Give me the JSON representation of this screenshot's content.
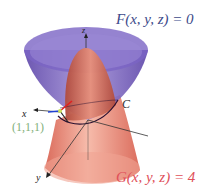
{
  "figure": {
    "surface_top_label": "F(x, y, z) = 0",
    "surface_bottom_label": "G(x, y, z) = 4",
    "curve_label": "C",
    "point_label": "(1,1,1)",
    "axes": {
      "x": "x",
      "y": "y",
      "z": "z"
    },
    "colors": {
      "cone_surface": "#6a4fb8",
      "paraboloid_surface": "#e8806c",
      "label_F": "#3d4a8a",
      "label_G": "#e0505a",
      "label_point": "#7fb07a",
      "normal_vector_red": "#e02020",
      "normal_vector_blue": "#2040d0"
    }
  }
}
